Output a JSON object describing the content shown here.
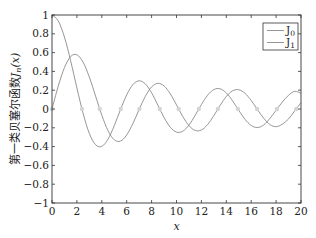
{
  "chart_data": {
    "type": "line",
    "title": "",
    "xlabel": "x",
    "ylabel": "第一类贝塞尔函数J_n(x)",
    "ylabel_prefix": "第一类贝塞尔函数",
    "ylabel_math": "J",
    "ylabel_sub": "n",
    "ylabel_arg": "(x)",
    "xlim": [
      0,
      20
    ],
    "ylim": [
      -1,
      1
    ],
    "xticks": [
      0,
      2,
      4,
      6,
      8,
      10,
      12,
      14,
      16,
      18,
      20
    ],
    "yticks": [
      -1,
      -0.8,
      -0.6,
      -0.4,
      -0.2,
      0,
      0.2,
      0.4,
      0.6,
      0.8,
      1
    ],
    "ytick_labels": [
      "−1",
      "−0.8",
      "−0.6",
      "−0.4",
      "−0.2",
      "0",
      "0.2",
      "0.4",
      "0.6",
      "0.8",
      "1"
    ],
    "grid": false,
    "legend_position": "upper right",
    "x": [
      0,
      0.5,
      1,
      1.5,
      2,
      2.5,
      3,
      3.5,
      4,
      4.5,
      5,
      5.5,
      6,
      6.5,
      7,
      7.5,
      8,
      8.5,
      9,
      9.5,
      10,
      10.5,
      11,
      11.5,
      12,
      12.5,
      13,
      13.5,
      14,
      14.5,
      15,
      15.5,
      16,
      16.5,
      17,
      17.5,
      18,
      18.5,
      19,
      19.5,
      20
    ],
    "series": [
      {
        "name": "J0",
        "label_main": "J",
        "label_sub": "0",
        "color": "#8a8a8a",
        "values": [
          1,
          0.9385,
          0.7652,
          0.5118,
          0.2239,
          -0.0484,
          -0.2601,
          -0.3801,
          -0.3971,
          -0.3205,
          -0.1776,
          -0.0068,
          0.1506,
          0.2601,
          0.3001,
          0.2663,
          0.1717,
          0.0419,
          -0.0903,
          -0.1939,
          -0.2459,
          -0.2366,
          -0.1712,
          -0.0677,
          0.0477,
          0.1469,
          0.2069,
          0.215,
          0.1711,
          0.0875,
          -0.0142,
          -0.1092,
          -0.1749,
          -0.1971,
          -0.1699,
          -0.1007,
          -0.0134,
          0.0738,
          0.1466,
          0.1884,
          0.167
        ]
      },
      {
        "name": "J1",
        "label_main": "J",
        "label_sub": "1",
        "color": "#8a8a8a",
        "values": [
          0,
          0.2423,
          0.4401,
          0.5579,
          0.5767,
          0.4971,
          0.3391,
          0.1374,
          -0.066,
          -0.2311,
          -0.3276,
          -0.3414,
          -0.2767,
          -0.1538,
          -0.0047,
          0.1352,
          0.2346,
          0.2731,
          0.2453,
          0.1613,
          0.0435,
          -0.0789,
          -0.1768,
          -0.2284,
          -0.2234,
          -0.1655,
          -0.0703,
          0.038,
          0.1334,
          0.1934,
          0.2051,
          0.1672,
          0.0904,
          -0.0058,
          -0.0977,
          -0.1654,
          -0.188,
          -0.1615,
          -0.1057,
          -0.019,
          0.0668
        ]
      }
    ],
    "zero_markers": {
      "color": "#d4d4d4",
      "x": [
        0,
        2.405,
        3.832,
        5.52,
        7.016,
        8.654,
        10.173,
        11.792,
        13.324,
        14.931,
        16.471,
        18.071,
        19.616
      ]
    }
  }
}
